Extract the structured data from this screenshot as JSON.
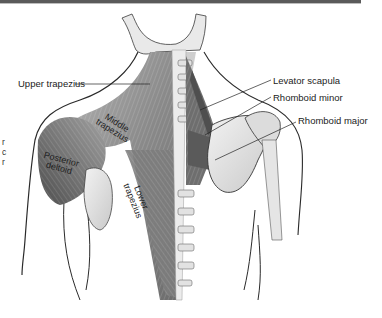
{
  "figure": {
    "callout_labels": [
      {
        "id": "upper_trapezius",
        "text": "Upper trapezius"
      },
      {
        "id": "levator_scapula",
        "text": "Levator scapula"
      },
      {
        "id": "rhomboid_minor",
        "text": "Rhomboid minor"
      },
      {
        "id": "rhomboid_major",
        "text": "Rhomboid major"
      }
    ],
    "inline_labels": {
      "middle_trapezius": [
        "Middle",
        "trapezius"
      ],
      "posterior_deltoid": [
        "Posterior",
        "deltoid"
      ],
      "lower_trapezius": [
        "Lower",
        "trapezius"
      ]
    },
    "cropped_edge_text": [
      "r",
      "c",
      "r"
    ]
  },
  "colors": {
    "background": "#ffffff",
    "muscle": "#8a8a8a",
    "muscle_dark": "#5e5e5e",
    "bone": "#e6e6e6",
    "outline": "#2a2a2a",
    "label_text": "#222222"
  }
}
